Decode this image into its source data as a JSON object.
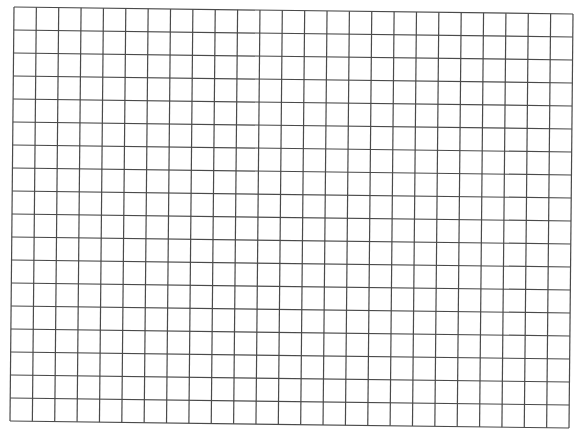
{
  "grid": {
    "columns": 25,
    "rows": 18,
    "line_color": "#4a4a4a",
    "background": "#ffffff",
    "corners": {
      "top_left": [
        14,
        7
      ],
      "top_right": [
        573,
        14
      ],
      "bottom_left": [
        10,
        421
      ],
      "bottom_right": [
        569,
        428
      ]
    }
  }
}
